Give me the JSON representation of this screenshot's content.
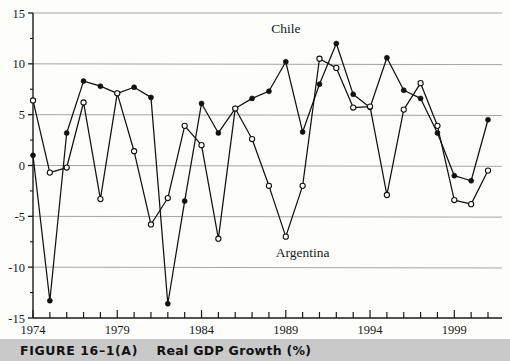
{
  "figure": {
    "caption_label": "FIGURE 16–1(A)",
    "caption_title": "Real GDP Growth (%)"
  },
  "chart_data": {
    "type": "line",
    "title": "Real GDP Growth (%)",
    "xlabel": "",
    "ylabel": "",
    "ylim": [
      -15,
      15
    ],
    "xlim": [
      1974,
      2001
    ],
    "yticks": [
      -15,
      -10,
      -5,
      0,
      5,
      10,
      15
    ],
    "ytick_labels": [
      "-15",
      "-10",
      "-5",
      "0",
      "5",
      "10",
      "15"
    ],
    "xticks": [
      1974,
      1975,
      1976,
      1977,
      1978,
      1979,
      1980,
      1981,
      1982,
      1983,
      1984,
      1985,
      1986,
      1987,
      1988,
      1989,
      1990,
      1991,
      1992,
      1993,
      1994,
      1995,
      1996,
      1997,
      1998,
      1999,
      2000,
      2001
    ],
    "xtick_labels": [
      "1974",
      "1979",
      "1984",
      "1989",
      "1994",
      "1999"
    ],
    "xtick_labeled_years": [
      1974,
      1979,
      1984,
      1989,
      1994,
      1999
    ],
    "grid": "horizontal",
    "legend": "inline-annotations",
    "x": [
      1974,
      1975,
      1976,
      1977,
      1978,
      1979,
      1980,
      1981,
      1982,
      1983,
      1984,
      1985,
      1986,
      1987,
      1988,
      1989,
      1990,
      1991,
      1992,
      1993,
      1994,
      1995,
      1996,
      1997,
      1998,
      1999,
      2000,
      2001
    ],
    "series": [
      {
        "name": "Chile",
        "marker": "filled-circle",
        "color": "#111111",
        "values": [
          1.0,
          -13.3,
          3.2,
          8.3,
          7.8,
          7.1,
          7.7,
          6.7,
          -13.6,
          -3.5,
          6.1,
          3.2,
          5.6,
          6.6,
          7.3,
          10.2,
          3.3,
          8.0,
          12.0,
          7.0,
          5.7,
          10.6,
          7.4,
          6.6,
          3.2,
          -1.0,
          -1.5,
          4.5
        ]
      },
      {
        "name": "Argentina",
        "marker": "open-circle",
        "color": "#111111",
        "values": [
          6.4,
          -0.7,
          -0.2,
          6.2,
          -3.3,
          7.1,
          1.4,
          -5.8,
          -3.2,
          3.9,
          2.0,
          -7.2,
          5.6,
          2.6,
          -2.0,
          -7.0,
          -2.0,
          10.5,
          9.6,
          5.7,
          5.8,
          -2.9,
          5.5,
          8.1,
          3.9,
          -3.4,
          -3.8,
          -0.5
        ]
      }
    ],
    "annotations": [
      {
        "text": "Chile",
        "x": 1989,
        "y": 13.0
      },
      {
        "text": "Argentina",
        "x": 1990,
        "y": -9.0
      }
    ]
  }
}
